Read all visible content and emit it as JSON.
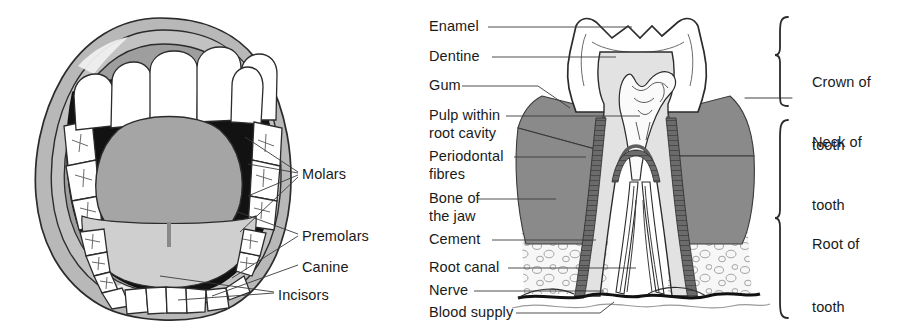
{
  "figure": {
    "background_color": "#ffffff"
  },
  "mouth_diagram": {
    "name": "open-mouth-dentition",
    "colors": {
      "lip": "#b8b8b8",
      "inner_gum": "#9b9b9b",
      "oral_cavity": "#111111",
      "tongue": "#a5a5a5",
      "tooth": "#ffffff",
      "outline": "#2b2b2b"
    },
    "labels": [
      {
        "id": "molars",
        "text": "Molars",
        "x": 302,
        "y": 175
      },
      {
        "id": "premolars",
        "text": "Premolars",
        "x": 302,
        "y": 237
      },
      {
        "id": "canine",
        "text": "Canine",
        "x": 302,
        "y": 268
      },
      {
        "id": "incisors",
        "text": "Incisors",
        "x": 278,
        "y": 296
      }
    ]
  },
  "tooth_diagram": {
    "name": "tooth-cross-section",
    "colors": {
      "enamel": "#ffffff",
      "dentine": "#e2e2e2",
      "pulp": "#f2f2f2",
      "gum": "#8a8a8a",
      "bone": "#f4f4f4",
      "cement": "#6e6e6e",
      "periodontal": "#555555",
      "outline": "#2b2b2b"
    },
    "left_labels": [
      {
        "id": "enamel",
        "text": "Enamel",
        "y": 27
      },
      {
        "id": "dentine",
        "text": "Dentine",
        "y": 57
      },
      {
        "id": "gum",
        "text": "Gum",
        "y": 86
      },
      {
        "id": "pulp-within",
        "text": "Pulp within",
        "y": 116
      },
      {
        "id": "root-cavity",
        "text": "root cavity",
        "y": 134
      },
      {
        "id": "periodontal",
        "text": "Periodontal",
        "y": 157
      },
      {
        "id": "fibres",
        "text": "fibres",
        "y": 175
      },
      {
        "id": "bone-of",
        "text": "Bone of",
        "y": 199
      },
      {
        "id": "the-jaw",
        "text": "the jaw",
        "y": 217
      },
      {
        "id": "cement",
        "text": "Cement",
        "y": 240
      },
      {
        "id": "root-canal",
        "text": "Root canal",
        "y": 268
      },
      {
        "id": "nerve",
        "text": "Nerve",
        "y": 291
      },
      {
        "id": "blood-supply",
        "text": "Blood supply",
        "y": 313
      }
    ],
    "bracket_labels": [
      {
        "id": "crown-of-tooth",
        "line1": "Crown of",
        "line2": "tooth",
        "y": 38
      },
      {
        "id": "neck-of-tooth",
        "line1": "Neck of",
        "line2": "tooth",
        "y": 98
      },
      {
        "id": "root-of-tooth",
        "line1": "Root of",
        "line2": "tooth",
        "y": 200
      }
    ]
  }
}
